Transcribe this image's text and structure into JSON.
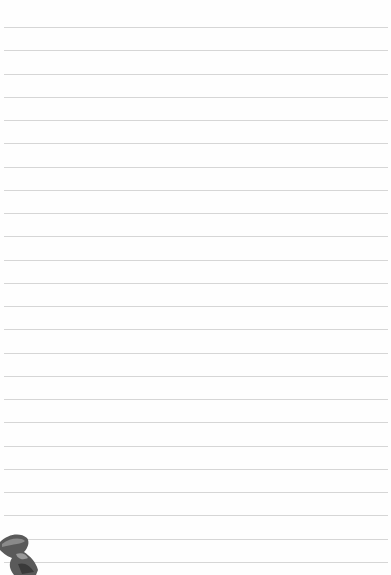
{
  "page": {
    "type": "lined-notepaper",
    "background_color": "#fefefe",
    "rule_color": "#d6d6d6",
    "rule_count": 24,
    "first_rule_y": 27,
    "rule_spacing": 23.26
  },
  "decoration": {
    "icon": "swallow-bird-icon",
    "position": "bottom-left"
  }
}
